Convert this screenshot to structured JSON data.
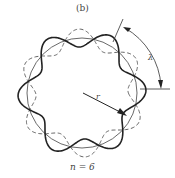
{
  "figure": {
    "panel_label": "(b)",
    "caption": "n = 6",
    "radius_label": "r",
    "arc_label": "λ"
  },
  "geometry": {
    "center": [
      82,
      93
    ],
    "base_radius": 55,
    "amplitude": 9,
    "n": 6
  },
  "colors": {
    "stroke": "#222222",
    "dashed": "#555555"
  }
}
